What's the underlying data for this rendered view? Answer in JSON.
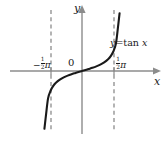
{
  "figure": {
    "background_color": "#ffffff",
    "axis_color": "#8c8c8c",
    "curve_color": "#1a1a1a",
    "asymptote_color": "#8c8c8c",
    "label_color": "#1a1a1a"
  },
  "labels": {
    "y_axis": "y",
    "x_axis": "x",
    "origin": "0",
    "curve_prefix": "y",
    "curve_equals": "=tan ",
    "curve_variable": "x",
    "curve_full": "y=tan x",
    "tick_left_sign": "−",
    "tick_left_numerator": "1",
    "tick_left_denominator": "2",
    "tick_left_symbol": "π",
    "tick_left_full": "−½π",
    "tick_right_numerator": "1",
    "tick_right_denominator": "2",
    "tick_right_symbol": "π",
    "tick_right_full": "½π"
  },
  "chart_data": {
    "type": "line",
    "xlabel": "x",
    "ylabel": "y",
    "xlim": [
      -2.2,
      2.2
    ],
    "ylim": [
      -6.0,
      6.0
    ],
    "grid": false,
    "legend": "none",
    "asymptotes": [
      {
        "axis": "vertical",
        "value": -1.5708,
        "label": "−½π",
        "style": "dashed"
      },
      {
        "axis": "vertical",
        "value": 1.5708,
        "label": "½π",
        "style": "dashed"
      }
    ],
    "series": [
      {
        "name": "y=tan x",
        "x": [
          -1.44,
          -1.38,
          -1.3,
          -1.2,
          -1.1,
          -1.0,
          -0.85,
          -0.7,
          -0.55,
          -0.4,
          -0.25,
          -0.1,
          0.0,
          0.1,
          0.25,
          0.4,
          0.55,
          0.7,
          0.85,
          1.0,
          1.1,
          1.2,
          1.3,
          1.38,
          1.44
        ],
        "y": [
          -7.6,
          -5.8,
          -3.6,
          -2.57,
          -1.96,
          -1.56,
          -1.14,
          -0.84,
          -0.61,
          -0.42,
          -0.26,
          -0.1,
          0.0,
          0.1,
          0.26,
          0.42,
          0.61,
          0.84,
          1.14,
          1.56,
          1.96,
          2.57,
          3.6,
          5.8,
          7.6
        ]
      }
    ],
    "xticks": [
      -1.5708,
      0,
      1.5708
    ],
    "xticklabels": [
      "−½π",
      "0",
      "½π"
    ]
  }
}
